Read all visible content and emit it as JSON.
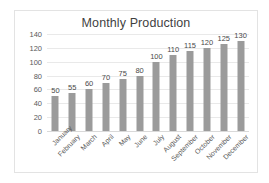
{
  "chart_data": {
    "type": "bar",
    "title": "Monthly Production",
    "xlabel": "",
    "ylabel": "",
    "categories": [
      "January",
      "February",
      "March",
      "April",
      "May",
      "June",
      "July",
      "August",
      "September",
      "October",
      "November",
      "December"
    ],
    "values": [
      50,
      55,
      60,
      70,
      75,
      80,
      100,
      110,
      115,
      120,
      125,
      130
    ],
    "data_labels": [
      "50",
      "55",
      "60",
      "70",
      "75",
      "80",
      "100",
      "110",
      "115",
      "120",
      "125",
      "130"
    ],
    "ylim": [
      0,
      140
    ],
    "y_ticks": [
      0,
      20,
      40,
      60,
      80,
      100,
      120,
      140
    ],
    "y_tick_labels": [
      "0",
      "20",
      "40",
      "60",
      "80",
      "100",
      "120",
      "140"
    ],
    "grid": true,
    "legend": false,
    "bar_color": "#9b9b9b",
    "gridline_color": "#e9e9e9",
    "title_color": "#3f3f3f",
    "axis_text_color": "#5a5a5a",
    "plot_background": "#ffffff",
    "frame_border_color": "#e3e3e3"
  }
}
